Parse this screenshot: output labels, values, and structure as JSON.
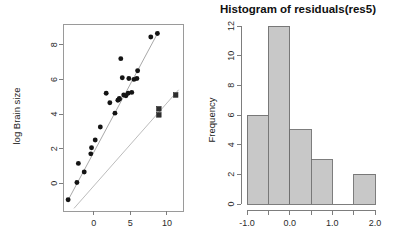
{
  "chart_data": [
    {
      "id": "scatter",
      "type": "scatter",
      "title": "",
      "xlabel": "",
      "ylabel": "log Brain size",
      "xlim": [
        -4.2,
        12.2
      ],
      "ylim": [
        -1.6,
        9.2
      ],
      "xticks": [
        0,
        5,
        10
      ],
      "xticklabels": [
        "0",
        "5",
        "10"
      ],
      "yticks": [
        0,
        2,
        4,
        6,
        8
      ],
      "yticklabels": [
        "0",
        "2",
        "4",
        "6",
        "8"
      ],
      "grid": false,
      "legend": "none",
      "series": [
        {
          "name": "circles",
          "marker": "circle",
          "points": [
            [
              -3.5,
              -0.95
            ],
            [
              -2.3,
              0.05
            ],
            [
              -2.1,
              1.15
            ],
            [
              -1.3,
              0.65
            ],
            [
              -0.4,
              1.7
            ],
            [
              -0.3,
              2.05
            ],
            [
              0.2,
              2.5
            ],
            [
              0.9,
              3.25
            ],
            [
              1.7,
              5.2
            ],
            [
              2.2,
              4.65
            ],
            [
              2.9,
              4.05
            ],
            [
              3.3,
              4.8
            ],
            [
              3.5,
              4.85
            ],
            [
              3.5,
              4.9
            ],
            [
              3.7,
              7.2
            ],
            [
              3.9,
              6.1
            ],
            [
              4.1,
              5.1
            ],
            [
              4.4,
              5.05
            ],
            [
              4.7,
              5.2
            ],
            [
              4.8,
              6.05
            ],
            [
              5.2,
              5.25
            ],
            [
              5.5,
              6.0
            ],
            [
              5.9,
              6.05
            ],
            [
              6.0,
              6.5
            ],
            [
              7.8,
              8.45
            ],
            [
              8.7,
              8.65
            ]
          ]
        },
        {
          "name": "squares",
          "marker": "square",
          "points": [
            [
              8.9,
              4.3
            ],
            [
              8.9,
              3.95
            ],
            [
              11.2,
              5.1
            ]
          ]
        }
      ],
      "lines": [
        {
          "name": "fit-upper",
          "x1": -3.6,
          "y1": -1.05,
          "x2": 8.9,
          "y2": 8.8,
          "shade": "dark"
        },
        {
          "name": "fit-lower",
          "x1": -2.7,
          "y1": -1.45,
          "x2": 11.6,
          "y2": 5.4,
          "shade": "light"
        }
      ]
    },
    {
      "id": "histogram",
      "type": "bar",
      "title": "Histogram of residuals(res5)",
      "xlabel": "",
      "ylabel": "Frequency",
      "bin_edges": [
        -1.0,
        -0.5,
        0.0,
        0.5,
        1.0,
        1.5,
        2.0
      ],
      "values": [
        6,
        12,
        5,
        3,
        0,
        2
      ],
      "categories": [
        "-1.0 to -0.5",
        "-0.5 to 0.0",
        "0.0 to 0.5",
        "0.5 to 1.0",
        "1.0 to 1.5",
        "1.5 to 2.0"
      ],
      "xlim": [
        -1.0,
        2.0
      ],
      "ylim": [
        0,
        12
      ],
      "xticks": [
        -1.0,
        -0.5,
        0.0,
        0.5,
        1.0,
        1.5,
        2.0
      ],
      "xticklabels": [
        "-1.0",
        "",
        "0.0",
        "",
        "1.0",
        "",
        "2.0"
      ],
      "yticks": [
        0,
        2,
        4,
        6,
        8,
        10,
        12
      ],
      "yticklabels": [
        "0",
        "2",
        "4",
        "6",
        "8",
        "10",
        "12"
      ],
      "grid": false,
      "legend": "none",
      "bar_fill": "#c8c8c8",
      "bar_stroke": "#6f6f6f"
    }
  ],
  "scatter": {
    "ylabel": "log Brain size"
  },
  "histogram": {
    "title": "Histogram of residuals(res5)",
    "ylabel": "Frequency"
  }
}
